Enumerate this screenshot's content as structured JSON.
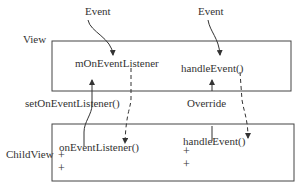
{
  "event_labels": {
    "left": "Event",
    "right": "Event"
  },
  "view": {
    "label": "View",
    "listener_field": "mOnEventListener",
    "handler_method": "handleEvent()"
  },
  "connections": {
    "set_listener": "setOnEventListener()",
    "override": "Override"
  },
  "child_view": {
    "label": "ChildView",
    "listener_method": "onEventListener()",
    "handler_method": "handleEvent()",
    "left_members": [
      "+",
      "+"
    ],
    "right_members": [
      "+",
      "+"
    ]
  }
}
